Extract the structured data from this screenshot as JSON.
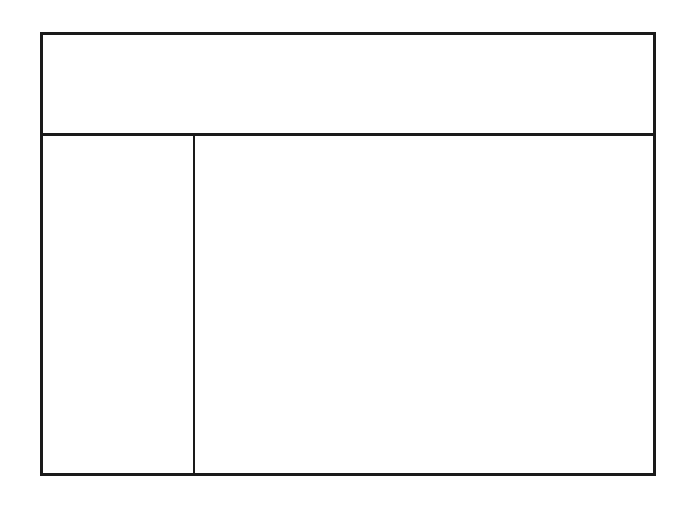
{
  "worksheet": {
    "character": "半",
    "stroke_order": {
      "total_strokes": 5,
      "steps": [
        {
          "step": 1,
          "highlighted_strokes": 1
        },
        {
          "step": 2,
          "highlighted_strokes": 2
        },
        {
          "step": 3,
          "highlighted_strokes": 3
        },
        {
          "step": 4,
          "highlighted_strokes": 4
        },
        {
          "step": 5,
          "highlighted_strokes": 5
        }
      ]
    },
    "practice_grid": {
      "rows": 3,
      "cols": 3
    },
    "colors": {
      "ink": "#111111",
      "ghost": "#9a9a9a",
      "guide": "#888888",
      "border": "#1a1a1a"
    }
  }
}
